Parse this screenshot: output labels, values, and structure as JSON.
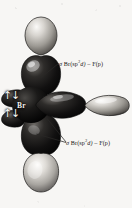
{
  "figure": {
    "central_atom": "Br",
    "background_color": "#f7f6f4",
    "ink_color": "#141414"
  },
  "atom": {
    "symbol": "Br"
  },
  "lone_pairs": [
    {
      "name": "lone-pair-upper",
      "glyph": "↑↓"
    },
    {
      "name": "lone-pair-lower",
      "glyph": "↑↓"
    }
  ],
  "callouts": {
    "axial": {
      "sigma": "σ",
      "donor": "Br(sp",
      "exponent": "3",
      "donor_tail": "d)",
      "dash": "–",
      "acceptor": "F(p)",
      "full_text": "σ Br(sp3d) – F(p)"
    },
    "equatorial": {
      "sigma": "σ",
      "donor": "Br(sp",
      "exponent": "3",
      "donor_tail": "d)",
      "dash": "–",
      "acceptor": "F(p)",
      "full_text": "σ Br(sp3d) – F(p)"
    }
  },
  "icons": {
    "leader_line": "leader-line",
    "orbital_lobe": "orbital-lobe"
  }
}
